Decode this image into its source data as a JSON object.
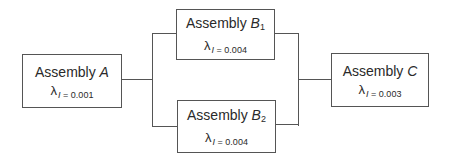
{
  "diagram": {
    "type": "reliability-block-diagram",
    "blocks": [
      {
        "id": "A",
        "prefix": "Assembly ",
        "name": "A",
        "subscript": "",
        "lambda_symbol": "λ",
        "rate_var": "I",
        "rate_eq": " = 0.001"
      },
      {
        "id": "B1",
        "prefix": "Assembly ",
        "name": "B",
        "subscript": "1",
        "lambda_symbol": "λ",
        "rate_var": "I",
        "rate_eq": " = 0.004"
      },
      {
        "id": "B2",
        "prefix": "Assembly ",
        "name": "B",
        "subscript": "2",
        "lambda_symbol": "λ",
        "rate_var": "I",
        "rate_eq": " = 0.004"
      },
      {
        "id": "C",
        "prefix": "Assembly ",
        "name": "C",
        "subscript": "",
        "lambda_symbol": "λ",
        "rate_var": "I",
        "rate_eq": " = 0.003"
      }
    ],
    "connections": [
      {
        "from": "A",
        "to": "B1"
      },
      {
        "from": "A",
        "to": "B2"
      },
      {
        "from": "B1",
        "to": "C"
      },
      {
        "from": "B2",
        "to": "C"
      }
    ],
    "colors": {
      "line": "#555555",
      "text": "#2a2a2a",
      "background": "#ffffff"
    }
  }
}
